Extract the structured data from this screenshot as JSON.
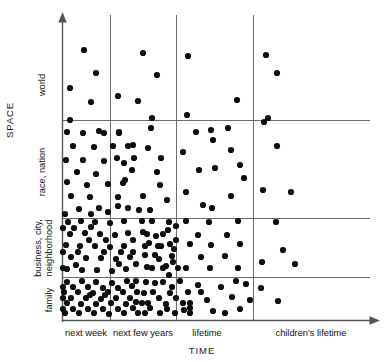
{
  "figure": {
    "y_axis_title": "SPACE",
    "x_axis_title": "TIME",
    "dot_color": "#0d0d0d",
    "grid_color": "#6b6b6b",
    "axis_color": "#555555",
    "background": "#ffffff"
  },
  "chart_data": {
    "type": "scatter",
    "title": "",
    "xlabel": "TIME",
    "ylabel": "SPACE",
    "grid": true,
    "legend": "none",
    "x_categories": [
      "next week",
      "next few years",
      "lifetime",
      "children's lifetime"
    ],
    "y_categories": [
      "family",
      "business, city, neighborhood",
      "race, nation",
      "world"
    ],
    "cell_counts": [
      {
        "x": "next week",
        "y": "family",
        "count": 44
      },
      {
        "x": "next few years",
        "y": "family",
        "count": 24
      },
      {
        "x": "lifetime",
        "y": "family",
        "count": 12
      },
      {
        "x": "children's lifetime",
        "y": "family",
        "count": 2
      },
      {
        "x": "next week",
        "y": "business, city, neighborhood",
        "count": 40
      },
      {
        "x": "next few years",
        "y": "business, city, neighborhood",
        "count": 26
      },
      {
        "x": "lifetime",
        "y": "business, city, neighborhood",
        "count": 13
      },
      {
        "x": "children's lifetime",
        "y": "business, city, neighborhood",
        "count": 4
      },
      {
        "x": "next week",
        "y": "race, nation",
        "count": 34
      },
      {
        "x": "next few years",
        "y": "race, nation",
        "count": 17
      },
      {
        "x": "lifetime",
        "y": "race, nation",
        "count": 13
      },
      {
        "x": "children's lifetime",
        "y": "race, nation",
        "count": 4
      },
      {
        "x": "next week",
        "y": "world",
        "count": 4
      },
      {
        "x": "next few years",
        "y": "world",
        "count": 4
      },
      {
        "x": "lifetime",
        "y": "world",
        "count": 4
      },
      {
        "x": "children's lifetime",
        "y": "world",
        "count": 3
      }
    ],
    "points": [
      [
        84,
        50
      ],
      [
        96,
        73
      ],
      [
        70,
        88
      ],
      [
        91,
        102
      ],
      [
        143,
        53
      ],
      [
        157,
        75
      ],
      [
        118,
        96
      ],
      [
        138,
        101
      ],
      [
        152,
        118
      ],
      [
        188,
        56
      ],
      [
        237,
        100
      ],
      [
        187,
        115
      ],
      [
        213,
        140
      ],
      [
        266,
        55
      ],
      [
        277,
        73
      ],
      [
        268,
        118
      ],
      [
        67,
        132
      ],
      [
        83,
        133
      ],
      [
        73,
        146
      ],
      [
        94,
        147
      ],
      [
        66,
        160
      ],
      [
        104,
        161
      ],
      [
        77,
        172
      ],
      [
        96,
        174
      ],
      [
        67,
        182
      ],
      [
        87,
        185
      ],
      [
        108,
        184
      ],
      [
        71,
        196
      ],
      [
        90,
        197
      ],
      [
        99,
        208
      ],
      [
        118,
        197
      ],
      [
        79,
        209
      ],
      [
        65,
        214
      ],
      [
        108,
        212
      ],
      [
        125,
        180
      ],
      [
        128,
        208
      ],
      [
        83,
        160
      ],
      [
        113,
        146
      ],
      [
        99,
        131
      ],
      [
        124,
        163
      ],
      [
        70,
        120
      ],
      [
        91,
        214
      ],
      [
        104,
        133
      ],
      [
        119,
        133
      ],
      [
        119,
        132
      ],
      [
        133,
        145
      ],
      [
        151,
        128
      ],
      [
        117,
        158
      ],
      [
        132,
        170
      ],
      [
        148,
        148
      ],
      [
        123,
        183
      ],
      [
        143,
        196
      ],
      [
        161,
        158
      ],
      [
        118,
        206
      ],
      [
        139,
        210
      ],
      [
        160,
        185
      ],
      [
        150,
        210
      ],
      [
        128,
        146
      ],
      [
        157,
        172
      ],
      [
        134,
        158
      ],
      [
        167,
        200
      ],
      [
        196,
        132
      ],
      [
        211,
        130
      ],
      [
        183,
        152
      ],
      [
        231,
        150
      ],
      [
        199,
        170
      ],
      [
        215,
        168
      ],
      [
        240,
        165
      ],
      [
        186,
        192
      ],
      [
        212,
        208
      ],
      [
        231,
        196
      ],
      [
        203,
        205
      ],
      [
        244,
        178
      ],
      [
        228,
        128
      ],
      [
        277,
        146
      ],
      [
        264,
        122
      ],
      [
        263,
        190
      ],
      [
        291,
        192
      ],
      [
        68,
        222
      ],
      [
        81,
        221
      ],
      [
        95,
        222
      ],
      [
        110,
        223
      ],
      [
        124,
        221
      ],
      [
        70,
        234
      ],
      [
        85,
        233
      ],
      [
        100,
        234
      ],
      [
        115,
        235
      ],
      [
        128,
        233
      ],
      [
        66,
        245
      ],
      [
        80,
        246
      ],
      [
        95,
        246
      ],
      [
        110,
        247
      ],
      [
        124,
        246
      ],
      [
        71,
        257
      ],
      [
        86,
        258
      ],
      [
        101,
        258
      ],
      [
        116,
        259
      ],
      [
        130,
        257
      ],
      [
        67,
        269
      ],
      [
        82,
        270
      ],
      [
        97,
        270
      ],
      [
        112,
        271
      ],
      [
        126,
        269
      ],
      [
        74,
        228
      ],
      [
        89,
        240
      ],
      [
        104,
        252
      ],
      [
        119,
        264
      ],
      [
        133,
        240
      ],
      [
        63,
        228
      ],
      [
        63,
        252
      ],
      [
        63,
        268
      ],
      [
        76,
        265
      ],
      [
        91,
        227
      ],
      [
        106,
        240
      ],
      [
        121,
        252
      ],
      [
        136,
        264
      ],
      [
        133,
        252
      ],
      [
        78,
        252
      ],
      [
        152,
        221
      ],
      [
        169,
        222
      ],
      [
        163,
        234
      ],
      [
        149,
        243
      ],
      [
        176,
        240
      ],
      [
        155,
        255
      ],
      [
        172,
        256
      ],
      [
        147,
        267
      ],
      [
        163,
        268
      ],
      [
        178,
        268
      ],
      [
        143,
        232
      ],
      [
        158,
        246
      ],
      [
        174,
        249
      ],
      [
        145,
        255
      ],
      [
        168,
        230
      ],
      [
        152,
        268
      ],
      [
        176,
        226
      ],
      [
        142,
        221
      ],
      [
        159,
        259
      ],
      [
        145,
        246
      ],
      [
        170,
        244
      ],
      [
        161,
        246
      ],
      [
        147,
        234
      ],
      [
        173,
        262
      ],
      [
        156,
        236
      ],
      [
        166,
        266
      ],
      [
        186,
        221
      ],
      [
        209,
        222
      ],
      [
        238,
        221
      ],
      [
        198,
        235
      ],
      [
        227,
        235
      ],
      [
        190,
        244
      ],
      [
        211,
        245
      ],
      [
        240,
        244
      ],
      [
        201,
        257
      ],
      [
        225,
        256
      ],
      [
        186,
        268
      ],
      [
        210,
        268
      ],
      [
        238,
        268
      ],
      [
        276,
        222
      ],
      [
        283,
        250
      ],
      [
        262,
        262
      ],
      [
        295,
        264
      ],
      [
        67,
        282
      ],
      [
        82,
        281
      ],
      [
        96,
        282
      ],
      [
        112,
        283
      ],
      [
        127,
        281
      ],
      [
        64,
        292
      ],
      [
        78,
        292
      ],
      [
        93,
        293
      ],
      [
        108,
        292
      ],
      [
        123,
        292
      ],
      [
        137,
        292
      ],
      [
        67,
        303
      ],
      [
        81,
        304
      ],
      [
        96,
        304
      ],
      [
        111,
        303
      ],
      [
        126,
        304
      ],
      [
        65,
        313
      ],
      [
        79,
        313
      ],
      [
        94,
        313
      ],
      [
        109,
        314
      ],
      [
        124,
        313
      ],
      [
        73,
        287
      ],
      [
        88,
        287
      ],
      [
        103,
        288
      ],
      [
        118,
        288
      ],
      [
        132,
        286
      ],
      [
        71,
        298
      ],
      [
        86,
        298
      ],
      [
        101,
        299
      ],
      [
        116,
        298
      ],
      [
        130,
        298
      ],
      [
        73,
        309
      ],
      [
        88,
        309
      ],
      [
        103,
        309
      ],
      [
        118,
        309
      ],
      [
        133,
        308
      ],
      [
        136,
        302
      ],
      [
        63,
        287
      ],
      [
        63,
        298
      ],
      [
        63,
        309
      ],
      [
        138,
        313
      ],
      [
        136,
        281
      ],
      [
        105,
        295
      ],
      [
        90,
        295
      ],
      [
        146,
        282
      ],
      [
        163,
        282
      ],
      [
        180,
        281
      ],
      [
        153,
        292
      ],
      [
        170,
        293
      ],
      [
        148,
        303
      ],
      [
        166,
        304
      ],
      [
        183,
        303
      ],
      [
        145,
        313
      ],
      [
        160,
        313
      ],
      [
        175,
        313
      ],
      [
        155,
        283
      ],
      [
        172,
        287
      ],
      [
        144,
        293
      ],
      [
        188,
        292
      ],
      [
        159,
        298
      ],
      [
        176,
        298
      ],
      [
        150,
        308
      ],
      [
        167,
        309
      ],
      [
        184,
        310
      ],
      [
        190,
        303
      ],
      [
        190,
        313
      ],
      [
        169,
        275
      ],
      [
        142,
        303
      ],
      [
        198,
        285
      ],
      [
        221,
        287
      ],
      [
        246,
        284
      ],
      [
        207,
        300
      ],
      [
        232,
        297
      ],
      [
        190,
        308
      ],
      [
        213,
        311
      ],
      [
        240,
        309
      ],
      [
        225,
        313
      ],
      [
        201,
        292
      ],
      [
        250,
        300
      ],
      [
        236,
        281
      ],
      [
        261,
        288
      ],
      [
        278,
        301
      ]
    ]
  }
}
